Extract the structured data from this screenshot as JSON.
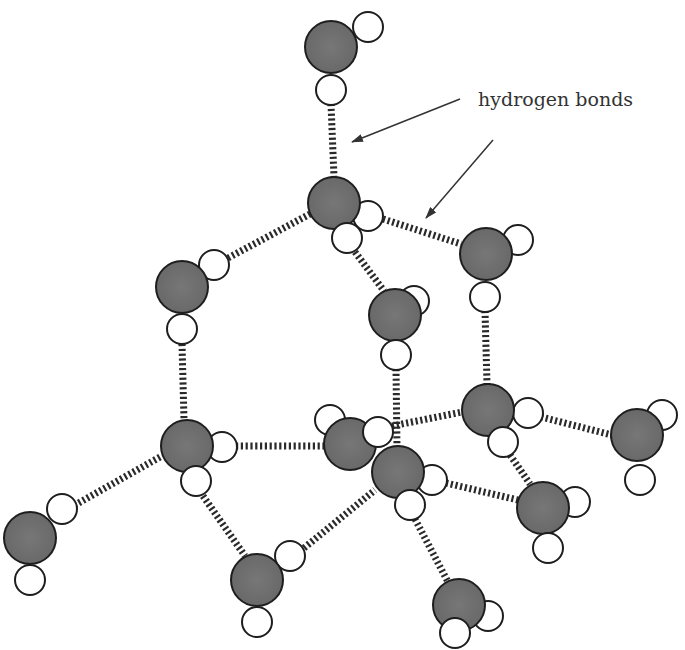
{
  "annotation": {
    "text": "hydrogen bonds",
    "x": 478,
    "y": 106,
    "arrows": [
      {
        "from": [
          460,
          99
        ],
        "to": [
          352,
          142
        ]
      },
      {
        "from": [
          493,
          140
        ],
        "to": [
          426,
          218
        ]
      }
    ]
  },
  "colors": {
    "oxygen": "#6e6e6e",
    "hydrogen": "#ffffff",
    "outline": "#1e1e1e",
    "bond": "#2a2a2a",
    "text": "#333333"
  },
  "legend": {
    "oxygen": "gray circle (O)",
    "hydrogen": "white circle (H)",
    "hydrogen_bond": "dashed ladder line"
  },
  "molecules": [
    {
      "id": "m1",
      "O": [
        331,
        47
      ],
      "H": [
        [
          368,
          27
        ],
        [
          331,
          90
        ]
      ]
    },
    {
      "id": "m2",
      "O": [
        334,
        203
      ],
      "H": [
        [
          368,
          216
        ],
        [
          347,
          238
        ]
      ]
    },
    {
      "id": "m3",
      "O": [
        182,
        287
      ],
      "H": [
        [
          214,
          265
        ],
        [
          182,
          329
        ]
      ]
    },
    {
      "id": "m4",
      "O": [
        486,
        254
      ],
      "H": [
        [
          518,
          240
        ],
        [
          485,
          297
        ]
      ]
    },
    {
      "id": "m5",
      "O": [
        395,
        315
      ],
      "H": [
        [
          414,
          301
        ],
        [
          396,
          355
        ]
      ]
    },
    {
      "id": "m6",
      "O": [
        187,
        446
      ],
      "H": [
        [
          222,
          447
        ],
        [
          196,
          481
        ]
      ]
    },
    {
      "id": "m7",
      "O": [
        350,
        444
      ],
      "H": [
        [
          330,
          420
        ],
        [
          378,
          432
        ]
      ]
    },
    {
      "id": "m8",
      "O": [
        398,
        472
      ],
      "H": [
        [
          432,
          480
        ],
        [
          410,
          505
        ]
      ]
    },
    {
      "id": "m9",
      "O": [
        488,
        410
      ],
      "H": [
        [
          528,
          413
        ],
        [
          503,
          442
        ]
      ]
    },
    {
      "id": "m10",
      "O": [
        637,
        435
      ],
      "H": [
        [
          662,
          415
        ],
        [
          640,
          480
        ]
      ]
    },
    {
      "id": "m11",
      "O": [
        543,
        508
      ],
      "H": [
        [
          575,
          502
        ],
        [
          548,
          548
        ]
      ]
    },
    {
      "id": "m12",
      "O": [
        30,
        538
      ],
      "H": [
        [
          62,
          509
        ],
        [
          30,
          580
        ]
      ]
    },
    {
      "id": "m13",
      "O": [
        257,
        580
      ],
      "H": [
        [
          290,
          556
        ],
        [
          257,
          622
        ]
      ]
    },
    {
      "id": "m14",
      "O": [
        459,
        605
      ],
      "H": [
        [
          488,
          616
        ],
        [
          455,
          633
        ]
      ]
    }
  ],
  "hydrogen_bonds": [
    {
      "from": [
        331,
        104
      ],
      "to": [
        334,
        177
      ]
    },
    {
      "from": [
        228,
        258
      ],
      "to": [
        310,
        214
      ]
    },
    {
      "from": [
        383,
        219
      ],
      "to": [
        461,
        244
      ]
    },
    {
      "from": [
        355,
        252
      ],
      "to": [
        384,
        291
      ]
    },
    {
      "from": [
        182,
        344
      ],
      "to": [
        184,
        420
      ]
    },
    {
      "from": [
        485,
        311
      ],
      "to": [
        487,
        384
      ]
    },
    {
      "from": [
        396,
        369
      ],
      "to": [
        397,
        446
      ]
    },
    {
      "from": [
        236,
        446
      ],
      "to": [
        324,
        446
      ]
    },
    {
      "from": [
        160,
        457
      ],
      "to": [
        75,
        505
      ]
    },
    {
      "from": [
        203,
        496
      ],
      "to": [
        245,
        556
      ]
    },
    {
      "from": [
        304,
        548
      ],
      "to": [
        375,
        490
      ]
    },
    {
      "from": [
        392,
        426
      ],
      "to": [
        462,
        412
      ]
    },
    {
      "from": [
        541,
        417
      ],
      "to": [
        612,
        435
      ]
    },
    {
      "from": [
        446,
        483
      ],
      "to": [
        518,
        500
      ]
    },
    {
      "from": [
        510,
        455
      ],
      "to": [
        530,
        484
      ]
    },
    {
      "from": [
        415,
        519
      ],
      "to": [
        448,
        582
      ]
    }
  ]
}
